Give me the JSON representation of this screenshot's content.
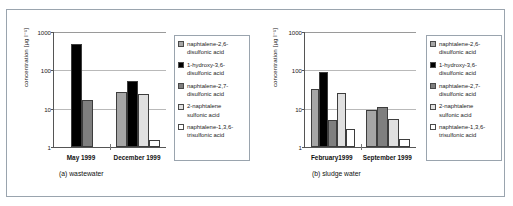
{
  "figure": {
    "outer_border_color": "#9aa4ae"
  },
  "series": [
    {
      "key": "nds26",
      "label": "naphtalene-2,6-disulfonic acid",
      "color": "#a6a6a6"
    },
    {
      "key": "h136",
      "label": "1-hydroxy-3,6-disulfonic acid",
      "color": "#000000"
    },
    {
      "key": "nds27",
      "label": "naphtalene-2,7-disulfonic acid",
      "color": "#7f7f7f"
    },
    {
      "key": "ns2",
      "label": "2-naphtalene sulfonic acid",
      "color": "#e0e0e0"
    },
    {
      "key": "nts136",
      "label": "naphtalene-1,3,6-trisulfonic acid",
      "color": "#ffffff"
    }
  ],
  "legend": {
    "items": [
      {
        "line1": "naphtalene-2,6-",
        "line2": "disulfonic acid"
      },
      {
        "line1": "1-hydroxy-3,6-",
        "line2": "disulfonic acid"
      },
      {
        "line1": "naphtalene-2,7-",
        "line2": "disulfonic acid"
      },
      {
        "line1": "2-naphtalene",
        "line2": "sulfonic acid"
      },
      {
        "line1": "naphtalene-1,3,6-",
        "line2": "trisulfonic acid"
      }
    ]
  },
  "panel_a": {
    "caption": "(a) wastewater",
    "ylabel": "concentration [µg l⁻¹]",
    "yticks": [
      "1000",
      "100",
      "10",
      "1"
    ]
  },
  "panel_b": {
    "caption": "(b) sludge water",
    "ylabel": "concentration [µg l⁻¹]",
    "yticks": [
      "1000",
      "100",
      "10",
      "1"
    ]
  },
  "chart_data": [
    {
      "type": "bar",
      "title": "(a) wastewater",
      "xlabel": "",
      "ylabel": "concentration [µg l⁻¹]",
      "yscale": "log",
      "ylim": [
        1,
        1000
      ],
      "yticks": [
        1,
        10,
        100,
        1000
      ],
      "grid": true,
      "legend_position": "right",
      "categories": [
        "May 1999",
        "December 1999"
      ],
      "series": [
        {
          "name": "naphtalene-2,6-disulfonic acid",
          "values": [
            null,
            28
          ]
        },
        {
          "name": "1-hydroxy-3,6-disulfonic acid",
          "values": [
            500,
            52
          ]
        },
        {
          "name": "naphtalene-2,7-disulfonic acid",
          "values": [
            17,
            null
          ]
        },
        {
          "name": "2-naphtalene sulfonic acid",
          "values": [
            null,
            24
          ]
        },
        {
          "name": "naphtalene-1,3,6-trisulfonic acid",
          "values": [
            null,
            1.5
          ]
        }
      ]
    },
    {
      "type": "bar",
      "title": "(b) sludge water",
      "xlabel": "",
      "ylabel": "concentration [µg l⁻¹]",
      "yscale": "log",
      "ylim": [
        1,
        1000
      ],
      "yticks": [
        1,
        10,
        100,
        1000
      ],
      "grid": true,
      "legend_position": "right",
      "categories": [
        "February1999",
        "September 1999"
      ],
      "series": [
        {
          "name": "naphtalene-2,6-disulfonic acid",
          "values": [
            33,
            9.5
          ]
        },
        {
          "name": "1-hydroxy-3,6-disulfonic acid",
          "values": [
            90,
            null
          ]
        },
        {
          "name": "naphtalene-2,7-disulfonic acid",
          "values": [
            5,
            11
          ]
        },
        {
          "name": "2-naphtalene sulfonic acid",
          "values": [
            25,
            5.5
          ]
        },
        {
          "name": "naphtalene-1,3,6-trisulfonic acid",
          "values": [
            3,
            1.6
          ]
        }
      ]
    }
  ]
}
